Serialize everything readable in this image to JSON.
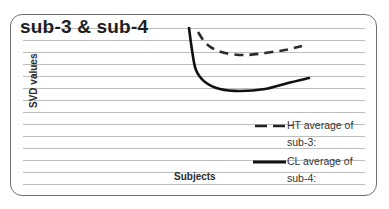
{
  "chart_data": {
    "type": "line",
    "title": "sub-3 & sub-4",
    "xlabel": "Subjects",
    "ylabel": "SVD values",
    "grid": true,
    "legend_position": "lower right",
    "series": [
      {
        "name": "HT average of sub-3:",
        "style": "dashed",
        "color": "#2b2b2b",
        "points": [
          [
            198,
            32
          ],
          [
            204,
            41
          ],
          [
            212,
            48
          ],
          [
            225,
            53
          ],
          [
            245,
            55
          ],
          [
            265,
            53
          ],
          [
            285,
            50
          ],
          [
            302,
            46
          ]
        ]
      },
      {
        "name": "CL average of sub-4:",
        "style": "solid",
        "color": "#111111",
        "points": [
          [
            189,
            28
          ],
          [
            192,
            50
          ],
          [
            196,
            70
          ],
          [
            205,
            82
          ],
          [
            220,
            89
          ],
          [
            240,
            91
          ],
          [
            265,
            89
          ],
          [
            288,
            83
          ],
          [
            309,
            78
          ]
        ]
      }
    ],
    "x_ticks": [],
    "y_ticks": []
  },
  "title": "sub-3 & sub-4",
  "axes": {
    "x_label": "Subjects",
    "y_label": "SVD values"
  },
  "legend": {
    "items": [
      {
        "line1": "HT average of",
        "line2": "sub-3:",
        "style": "dashed"
      },
      {
        "line1": "CL average of",
        "line2": "sub-4:",
        "style": "solid"
      }
    ]
  }
}
